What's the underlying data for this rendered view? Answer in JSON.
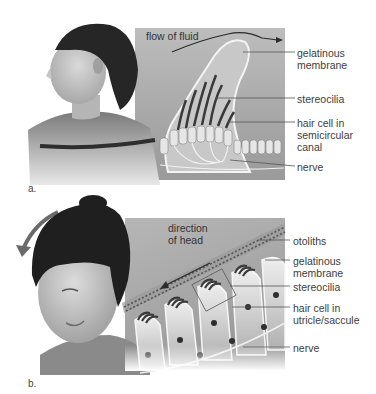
{
  "figure": {
    "panel_a": {
      "letter": "a.",
      "annotation": "flow of fluid",
      "labels": [
        {
          "text": "gelatinous\nmembrane"
        },
        {
          "text": "stereocilia"
        },
        {
          "text": "hair cell in\nsemicircular\ncanal"
        },
        {
          "text": "nerve"
        }
      ]
    },
    "panel_b": {
      "letter": "b.",
      "annotation": "direction\nof head",
      "labels": [
        {
          "text": "otoliths"
        },
        {
          "text": "gelatinous\nmembrane"
        },
        {
          "text": "stereocilia"
        },
        {
          "text": "hair cell in\nutricle/saccule"
        },
        {
          "text": "nerve"
        }
      ]
    }
  }
}
